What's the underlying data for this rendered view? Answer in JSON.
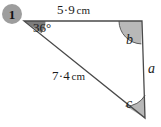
{
  "figure": {
    "question_number": "1",
    "shape": "triangle",
    "side_labels": {
      "top": {
        "value": "5·9",
        "unit": "cm",
        "full": "5·9 cm"
      },
      "hypotenuse": {
        "value": "7·4",
        "unit": "cm",
        "full": "7·4 cm"
      },
      "right": {
        "full": "a"
      }
    },
    "angle_labels": {
      "left": "36°",
      "top_right": "b",
      "bottom_right": "c"
    },
    "colors": {
      "stroke": "#4a4a4a",
      "badge_fill": "#9d9d9d",
      "angle_fill": "#b5b5b5",
      "angle_fill_dark": "#8a8a8a",
      "text": "#1c1c1c",
      "background": "#ffffff"
    },
    "vertices": {
      "left": {
        "x": 24,
        "y": 21
      },
      "top_right": {
        "x": 142,
        "y": 21
      },
      "bottom_right": {
        "x": 145,
        "y": 118
      }
    }
  }
}
